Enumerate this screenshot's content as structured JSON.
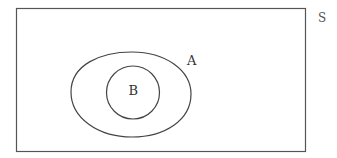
{
  "diagram": {
    "type": "venn",
    "universe": {
      "label": "S"
    },
    "sets": [
      {
        "id": "A",
        "label": "A",
        "contains": [
          "B"
        ]
      },
      {
        "id": "B",
        "label": "B",
        "subset_of": "A"
      }
    ],
    "colors": {
      "stroke": "#444444",
      "background": "#ffffff",
      "text": "#333333"
    }
  }
}
